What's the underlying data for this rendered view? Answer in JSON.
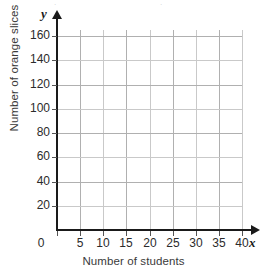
{
  "chart_data": {
    "type": "scatter",
    "title": "",
    "subtitle": "",
    "xlabel": "Number of students",
    "ylabel": "Number of orange slices",
    "x_var": "x",
    "y_var": "y",
    "xlim": [
      0,
      40
    ],
    "ylim": [
      0,
      160
    ],
    "x_ticks": [
      0,
      5,
      10,
      15,
      20,
      25,
      30,
      35,
      40
    ],
    "y_ticks": [
      20,
      40,
      60,
      80,
      100,
      120,
      140,
      160
    ],
    "x_tick_labels": [
      "0",
      "5",
      "10",
      "15",
      "20",
      "25",
      "30",
      "35",
      "40"
    ],
    "y_tick_labels": [
      "20",
      "40",
      "60",
      "80",
      "100",
      "120",
      "140",
      "160"
    ],
    "x_tick_step": 5,
    "y_tick_step": 20,
    "grid": true,
    "legend": null,
    "series": [],
    "values": [],
    "annotations": [],
    "note": "Empty coordinate grid with no plotted data points"
  },
  "axes": {
    "y_axis_name": "y",
    "x_axis_name": "x",
    "origin_label": "0"
  },
  "colors": {
    "background": "#ffffff",
    "axis": "#1a1a1a",
    "gridline": "#c9c9c9",
    "gridline_strong": "#b0b0b0",
    "tick_label": "#2b2b2b",
    "axis_title": "#3a3a3a"
  }
}
